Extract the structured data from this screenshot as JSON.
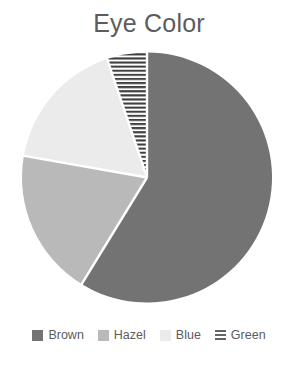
{
  "chart_data": {
    "type": "pie",
    "title": "Eye Color",
    "subtitle": "",
    "xlabel": "",
    "ylabel": "",
    "categories": [
      "Brown",
      "Hazel",
      "Blue",
      "Green"
    ],
    "values": [
      58.7,
      19.0,
      17.1,
      5.2
    ],
    "units": "percent",
    "start_angle_deg": 0,
    "direction": "clockwise",
    "slices": [
      {
        "label": "Brown",
        "value": 58.7,
        "start_angle_deg": 0.0,
        "end_angle_deg": 211.5,
        "sweep_deg": 211.5,
        "fill": "#737373",
        "pattern": "solid"
      },
      {
        "label": "Hazel",
        "value": 19.0,
        "start_angle_deg": 211.5,
        "end_angle_deg": 280.0,
        "sweep_deg": 68.5,
        "fill": "#b9b9b9",
        "pattern": "solid"
      },
      {
        "label": "Blue",
        "value": 17.1,
        "start_angle_deg": 280.0,
        "end_angle_deg": 341.4,
        "sweep_deg": 61.4,
        "fill": "#ebebeb",
        "pattern": "solid"
      },
      {
        "label": "Green",
        "value": 5.2,
        "start_angle_deg": 341.4,
        "end_angle_deg": 360.0,
        "sweep_deg": 18.6,
        "fill": "#ffffff",
        "pattern": "horizontal-lines"
      }
    ],
    "legend": {
      "position": "bottom",
      "entries": [
        {
          "label": "Brown",
          "swatch": "#737373",
          "pattern": "solid"
        },
        {
          "label": "Hazel",
          "swatch": "#b9b9b9",
          "pattern": "solid"
        },
        {
          "label": "Blue",
          "swatch": "#ebebeb",
          "pattern": "solid"
        },
        {
          "label": "Green",
          "swatch": "#ffffff",
          "pattern": "horizontal-lines"
        }
      ]
    },
    "grid": false,
    "data_labels": false,
    "geometry": {
      "center_x": 147,
      "center_y": 177.5,
      "radius": 125,
      "separator_color": "#ffffff",
      "separator_width": 2.4
    },
    "colors": {
      "title_text": "#5c5c5c",
      "legend_text": "#5c5c5c",
      "background": "#ffffff",
      "hatch_line": "#3f3f3f"
    }
  }
}
